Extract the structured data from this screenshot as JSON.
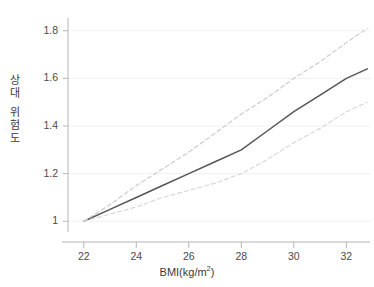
{
  "chart_data": {
    "type": "line",
    "title": "",
    "subtitle": "",
    "xlabel": "BMI(kg/m2)",
    "xlabel_base": "BMI(kg/m",
    "xlabel_sup": "2",
    "xlabel_close": ")",
    "ylabel": "상대 위험도",
    "ylabel_chars": [
      "상",
      "대",
      "위",
      "험",
      "도"
    ],
    "xlim": [
      21.4,
      32.9
    ],
    "ylim": [
      0.955,
      1.845
    ],
    "xticks": [
      22,
      24,
      26,
      28,
      30,
      32
    ],
    "xtick_labels": [
      "22",
      "24",
      "26",
      "28",
      "30",
      "32"
    ],
    "yticks": [
      1,
      1.2,
      1.4,
      1.6,
      1.8
    ],
    "ytick_labels": [
      "1",
      "1.2",
      "1.4",
      "1.6",
      "1.8"
    ],
    "grid": "horizontal",
    "legend": "none",
    "x": [
      22,
      23,
      24,
      25,
      26,
      27,
      28,
      29,
      30,
      31,
      32,
      32.8
    ],
    "series": [
      {
        "name": "상대 위험도 추정치",
        "style": "solid",
        "color": "#555555",
        "values": [
          1.0,
          1.05,
          1.1,
          1.15,
          1.2,
          1.25,
          1.3,
          1.38,
          1.46,
          1.53,
          1.6,
          1.64
        ]
      },
      {
        "name": "95% 신뢰구간 상한",
        "style": "dashed",
        "color": "#cccccc",
        "values": [
          1.0,
          1.07,
          1.15,
          1.22,
          1.29,
          1.37,
          1.45,
          1.52,
          1.6,
          1.67,
          1.75,
          1.81
        ]
      },
      {
        "name": "95% 신뢰구간 하한",
        "style": "dashed",
        "color": "#d8d8d8",
        "values": [
          1.0,
          1.03,
          1.06,
          1.1,
          1.13,
          1.16,
          1.2,
          1.26,
          1.33,
          1.39,
          1.46,
          1.5
        ]
      }
    ],
    "colors": {
      "estimate_line": "#555555",
      "upper_band": "#cccccc",
      "lower_band": "#d8d8d8",
      "gridline": "#f0f0f0",
      "axis": "#b5b5b5",
      "tick_text": "#4a4a4a",
      "background": "#ffffff"
    }
  }
}
